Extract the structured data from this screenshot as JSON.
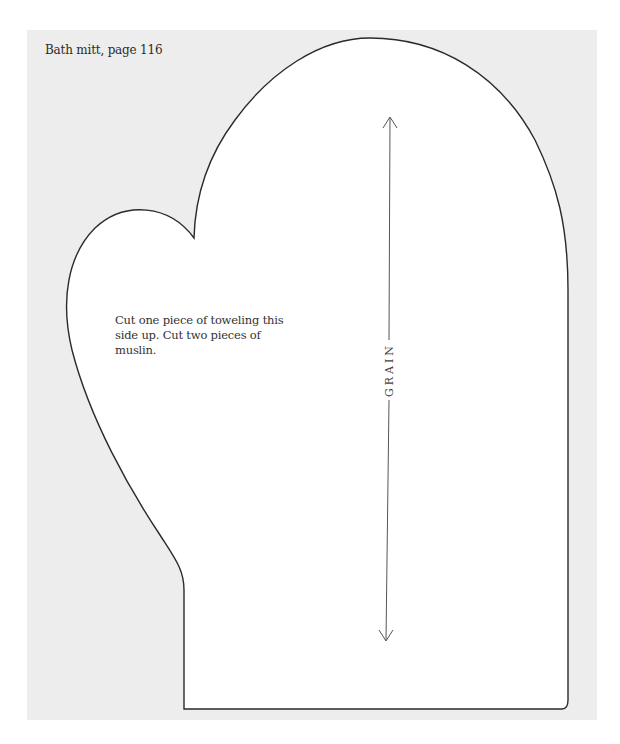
{
  "page": {
    "caption": "Bath mitt, page 116",
    "background_color": "#ededed",
    "pattern_fill": "#ffffff",
    "outline_color": "#2a2a2a"
  },
  "pattern": {
    "name": "Bath mitt",
    "instructions": "Cut one piece of toweling this side up. Cut two pieces of muslin.",
    "grain_label": "GRAIN",
    "grain_arrow": {
      "top_tip": [
        390,
        117
      ],
      "bottom_tip": [
        386,
        641
      ]
    }
  }
}
